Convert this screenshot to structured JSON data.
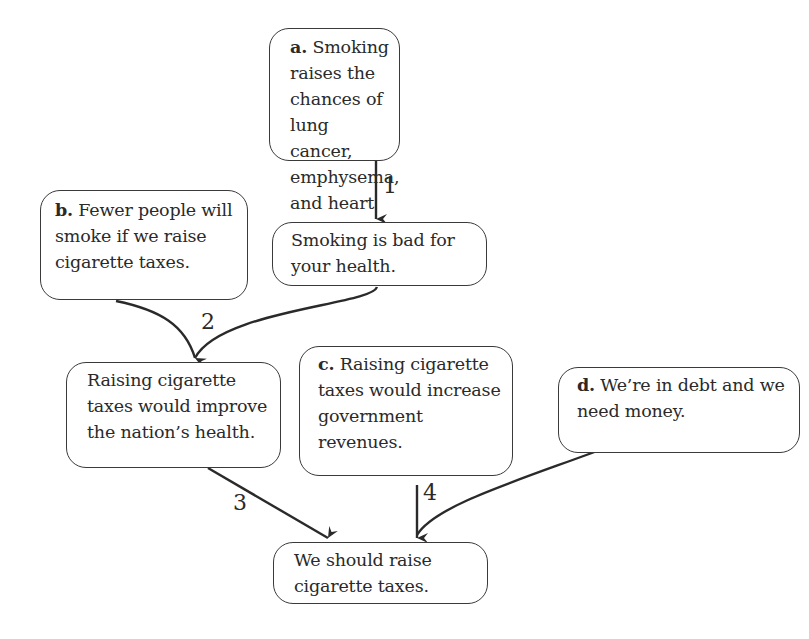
{
  "diagram": {
    "type": "argument-map",
    "nodes": {
      "a": {
        "tag": "a.",
        "text": "Smoking raises the chances of lung cancer, emphysema, and heart disease."
      },
      "health": {
        "tag": "",
        "text": "Smoking is bad for your health."
      },
      "b": {
        "tag": "b.",
        "text": "Fewer people will smoke if we raise cigarette taxes."
      },
      "improve": {
        "tag": "",
        "text": "Raising cigarette taxes would improve the nation’s health."
      },
      "c": {
        "tag": "c.",
        "text": "Raising cigarette taxes would increase government revenues."
      },
      "d": {
        "tag": "d.",
        "text": "We’re in debt and we need money."
      },
      "conclusion": {
        "tag": "",
        "text": "We should raise cigarette taxes."
      }
    },
    "edges": [
      {
        "label": "1",
        "from": [
          "a"
        ],
        "to": "health"
      },
      {
        "label": "2",
        "from": [
          "b",
          "health"
        ],
        "to": "improve"
      },
      {
        "label": "3",
        "from": [
          "improve"
        ],
        "to": "conclusion"
      },
      {
        "label": "4",
        "from": [
          "c",
          "d"
        ],
        "to": "conclusion"
      }
    ],
    "colors": {
      "stroke": "#2a2a2a",
      "background": "#ffffff"
    }
  }
}
